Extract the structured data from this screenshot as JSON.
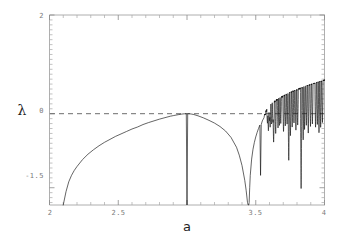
{
  "chart_data": {
    "type": "line",
    "title": "",
    "subtitle": "",
    "xlabel": "a",
    "ylabel": "λ",
    "xlim": [
      2,
      4
    ],
    "ylim": [
      -1.85,
      2
    ],
    "grid": false,
    "legend": null,
    "annotations": [
      {
        "kind": "reference-line",
        "axis": "y",
        "value": 0,
        "style": "dashed",
        "label": ""
      }
    ],
    "x_ticks_major": [
      2,
      2.5,
      3,
      3.5,
      4
    ],
    "x_tick_labels": [
      "2",
      "2.5",
      "",
      "3.5",
      "4"
    ],
    "x_ticks_minor_step": 0.1,
    "y_ticks_major": [
      -1.5,
      0,
      2
    ],
    "y_tick_labels": [
      "-1.5",
      "0",
      "2"
    ],
    "y_ticks_minor_step": 0.1,
    "series_name": "Lyapunov exponent of the logistic map",
    "curve_points_x": [
      2.1,
      2.12,
      2.14,
      2.16,
      2.18,
      2.2,
      2.24,
      2.28,
      2.32,
      2.36,
      2.4,
      2.44,
      2.48,
      2.52,
      2.56,
      2.6,
      2.64,
      2.68,
      2.72,
      2.76,
      2.8,
      2.84,
      2.88,
      2.9,
      2.92,
      2.94,
      2.96,
      2.97,
      2.98,
      2.985,
      2.99,
      2.995,
      3.0,
      3.005,
      3.01,
      3.015,
      3.02,
      3.03,
      3.05,
      3.08,
      3.12,
      3.16,
      3.2,
      3.24,
      3.28,
      3.32,
      3.36,
      3.38,
      3.4,
      3.42,
      3.43,
      3.44,
      3.445,
      3.449,
      3.452,
      3.456,
      3.46,
      3.47,
      3.48,
      3.49,
      3.5,
      3.51,
      3.52,
      3.53,
      3.535,
      3.54,
      3.545,
      3.55,
      3.555,
      3.56,
      3.565,
      3.57,
      3.575,
      3.58,
      3.585,
      3.59,
      3.6,
      3.61,
      3.62,
      3.63,
      3.64,
      3.65,
      3.655,
      3.66,
      3.665,
      3.67,
      3.675,
      3.68,
      3.69,
      3.7,
      3.71,
      3.72,
      3.73,
      3.735,
      3.74,
      3.745,
      3.75,
      3.755,
      3.76,
      3.77,
      3.78,
      3.79,
      3.8,
      3.81,
      3.82,
      3.825,
      3.83,
      3.835,
      3.84,
      3.845,
      3.85,
      3.855,
      3.86,
      3.87,
      3.88,
      3.89,
      3.9,
      3.91,
      3.92,
      3.925,
      3.93,
      3.935,
      3.94,
      3.95,
      3.96,
      3.97,
      3.98,
      3.99,
      4.0
    ],
    "curve_points_y": [
      -1.85,
      -1.58,
      -1.38,
      -1.25,
      -1.15,
      -1.07,
      -0.93,
      -0.82,
      -0.73,
      -0.65,
      -0.58,
      -0.52,
      -0.46,
      -0.41,
      -0.36,
      -0.31,
      -0.27,
      -0.22,
      -0.18,
      -0.145,
      -0.11,
      -0.08,
      -0.05,
      -0.039,
      -0.028,
      -0.018,
      -0.009,
      -0.005,
      -0.0022,
      -0.0012,
      -0.0005,
      -0.0001,
      -1.85,
      -0.0001,
      -0.0006,
      -0.0014,
      -0.0025,
      -0.006,
      -0.017,
      -0.043,
      -0.085,
      -0.135,
      -0.19,
      -0.26,
      -0.35,
      -0.48,
      -0.68,
      -0.84,
      -1.05,
      -1.35,
      -1.55,
      -1.8,
      -1.85,
      -1.85,
      -1.8,
      -1.5,
      -1.25,
      -0.92,
      -0.72,
      -0.58,
      -0.47,
      -0.38,
      -0.3,
      -0.23,
      -1.25,
      -0.22,
      -0.17,
      -0.13,
      -0.11,
      -0.08,
      -0.05,
      -0.02,
      0.02,
      0.06,
      0.1,
      0.14,
      0.2,
      0.24,
      0.28,
      0.31,
      0.34,
      0.36,
      -0.6,
      0.3,
      0.33,
      0.35,
      0.37,
      0.33,
      0.36,
      0.38,
      0.4,
      0.41,
      -0.95,
      0.33,
      0.38,
      0.41,
      0.43,
      0.44,
      0.45,
      0.46,
      0.47,
      0.47,
      0.46,
      0.44,
      -1.55,
      0.25,
      0.35,
      0.41,
      0.44,
      0.46,
      0.47,
      0.48,
      0.49,
      0.5,
      0.51,
      0.52,
      0.53,
      0.54,
      -0.4,
      0.4,
      0.48,
      0.52,
      0.55,
      0.57,
      0.58,
      0.6,
      0.61,
      0.62
    ],
    "windows": [
      {
        "a": 3.0,
        "type": "period-doubling",
        "depth": "axis-bottom"
      },
      {
        "a": 3.449,
        "type": "period-doubling",
        "depth": "axis-bottom"
      },
      {
        "a": 3.545,
        "type": "period-doubling",
        "depth": -1.25
      },
      {
        "a": 3.63,
        "type": "periodic-window",
        "depth": -0.6
      },
      {
        "a": 3.74,
        "type": "period-5 window",
        "depth": -0.95
      },
      {
        "a": 3.83,
        "type": "period-3 window",
        "depth": -1.55
      },
      {
        "a": 3.96,
        "type": "periodic-window",
        "depth": -0.4
      }
    ]
  }
}
